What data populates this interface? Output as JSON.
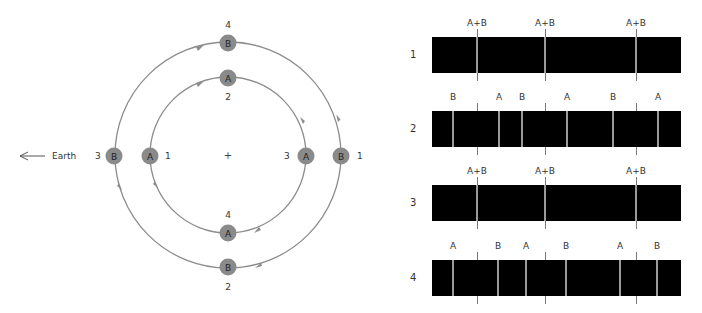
{
  "orbit_diagram": {
    "earth_label": "Earth",
    "center_marker": "+",
    "colors": {
      "orbit": "#8c8c8c",
      "star_fill": "#8a8a8a",
      "star_text": "#222222"
    },
    "outer_orbit": {
      "star": "B",
      "positions": [
        {
          "phase": "1",
          "side": "right"
        },
        {
          "phase": "2",
          "side": "bottom"
        },
        {
          "phase": "3",
          "side": "left"
        },
        {
          "phase": "4",
          "side": "top"
        }
      ]
    },
    "inner_orbit": {
      "star": "A",
      "positions": [
        {
          "phase": "1",
          "side": "left"
        },
        {
          "phase": "2",
          "side": "top"
        },
        {
          "phase": "3",
          "side": "right"
        },
        {
          "phase": "4",
          "side": "bottom"
        }
      ]
    }
  },
  "spectra": [
    {
      "label": "1",
      "lines": [
        {
          "label": "A+B",
          "x": 477
        },
        {
          "label": "A+B",
          "x": 545
        },
        {
          "label": "A+B",
          "x": 636
        }
      ]
    },
    {
      "label": "2",
      "lines": [
        {
          "label": "B",
          "x": 453
        },
        {
          "label": "A",
          "x": 499
        },
        {
          "label": "B",
          "x": 522
        },
        {
          "label": "A",
          "x": 567
        },
        {
          "label": "B",
          "x": 613
        },
        {
          "label": "A",
          "x": 658
        }
      ]
    },
    {
      "label": "3",
      "lines": [
        {
          "label": "A+B",
          "x": 477
        },
        {
          "label": "A+B",
          "x": 545
        },
        {
          "label": "A+B",
          "x": 636
        }
      ]
    },
    {
      "label": "4",
      "lines": [
        {
          "label": "A",
          "x": 453
        },
        {
          "label": "B",
          "x": 498
        },
        {
          "label": "A",
          "x": 526
        },
        {
          "label": "B",
          "x": 566
        },
        {
          "label": "A",
          "x": 620
        },
        {
          "label": "B",
          "x": 657
        }
      ]
    }
  ],
  "reference_ticks": [
    477,
    545,
    636
  ]
}
